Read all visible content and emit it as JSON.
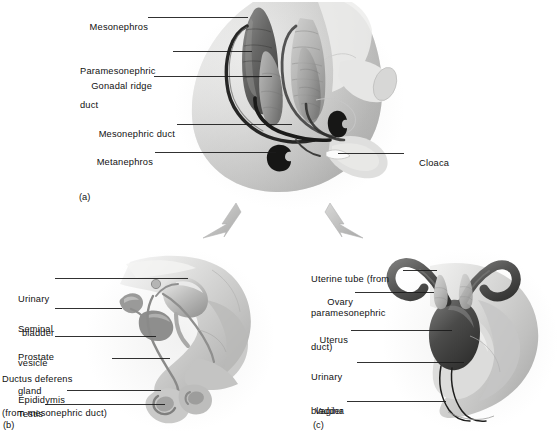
{
  "figure": {
    "background_color": "#ffffff",
    "text_color": "#111111",
    "leader_line_color": "#1b1b1b",
    "arrow_color": "#bdbdbd"
  },
  "panels": [
    {
      "id": "a",
      "id_label": "(a)",
      "name": "indifferent-stage-embryo",
      "labels": [
        {
          "key": "mesonephros",
          "text": "Mesonephros",
          "lines": [
            "Mesonephros"
          ]
        },
        {
          "key": "paramesonephric-duct",
          "text": "Paramesonephric duct",
          "lines": [
            "Paramesonephric",
            "duct"
          ]
        },
        {
          "key": "gonadal-ridge",
          "text": "Gonadal ridge",
          "lines": [
            "Gonadal ridge"
          ]
        },
        {
          "key": "mesonephric-duct",
          "text": "Mesonephric duct",
          "lines": [
            "Mesonephric duct"
          ]
        },
        {
          "key": "metanephros",
          "text": "Metanephros",
          "lines": [
            "Metanephros"
          ]
        },
        {
          "key": "cloaca",
          "text": "Cloaca",
          "lines": [
            "Cloaca"
          ]
        }
      ]
    },
    {
      "id": "b",
      "id_label": "(b)",
      "name": "male-reproductive-system",
      "labels": [
        {
          "key": "urinary-bladder",
          "text": "Urinary bladder",
          "lines": [
            "Urinary",
            "bladder"
          ]
        },
        {
          "key": "seminal-vesicle",
          "text": "Seminal vesicle",
          "lines": [
            "Seminal",
            "vesicle"
          ]
        },
        {
          "key": "prostate-gland",
          "text": "Prostate gland",
          "lines": [
            "Prostate",
            "gland"
          ]
        },
        {
          "key": "ductus-deferens",
          "text": "Ductus deferens (from mesonephric duct)",
          "lines": [
            "Ductus deferens",
            "(from mesonephric duct)"
          ]
        },
        {
          "key": "epididymis",
          "text": "Epididymis",
          "lines": [
            "Epididymis"
          ]
        },
        {
          "key": "testis",
          "text": "Testis",
          "lines": [
            "Testis"
          ]
        }
      ]
    },
    {
      "id": "c",
      "id_label": "(c)",
      "name": "female-reproductive-system",
      "labels": [
        {
          "key": "uterine-tube",
          "text": "Uterine tube (from paramesonephric duct)",
          "lines": [
            "Uterine tube (from",
            "paramesonephric",
            "duct)"
          ]
        },
        {
          "key": "ovary",
          "text": "Ovary",
          "lines": [
            "Ovary"
          ]
        },
        {
          "key": "uterus",
          "text": "Uterus",
          "lines": [
            "Uterus"
          ]
        },
        {
          "key": "urinary-bladder",
          "text": "Urinary bladder",
          "lines": [
            "Urinary",
            "bladder"
          ]
        },
        {
          "key": "vagina",
          "text": "Vagina",
          "lines": [
            "Vagina"
          ]
        }
      ]
    }
  ],
  "arrows": [
    {
      "key": "arrow-to-male",
      "from_panel": "a",
      "to_panel": "b",
      "direction": "down-left"
    },
    {
      "key": "arrow-to-female",
      "from_panel": "a",
      "to_panel": "c",
      "direction": "down-right"
    }
  ],
  "label_text": {
    "a_mesonephros_l1": "Mesonephros",
    "a_paramesonephric_l1": "Paramesonephric",
    "a_paramesonephric_l2": "duct",
    "a_gonadal_l1": "Gonadal ridge",
    "a_mesonephric_duct_l1": "Mesonephric duct",
    "a_metanephros_l1": "Metanephros",
    "a_cloaca_l1": "Cloaca",
    "a_panel_id": "(a)",
    "b_bladder_l1": "Urinary",
    "b_bladder_l2": "bladder",
    "b_seminal_l1": "Seminal",
    "b_seminal_l2": "vesicle",
    "b_prostate_l1": "Prostate",
    "b_prostate_l2": "gland",
    "b_ductus_l1": "Ductus deferens",
    "b_ductus_l2": "(from mesonephric duct)",
    "b_epididymis_l1": "Epididymis",
    "b_testis_l1": "Testis",
    "b_panel_id": "(b)",
    "c_tube_l1": "Uterine tube (from",
    "c_tube_l2": "paramesonephric",
    "c_tube_l3": "duct)",
    "c_ovary_l1": "Ovary",
    "c_uterus_l1": "Uterus",
    "c_bladder_l1": "Urinary",
    "c_bladder_l2": "bladder",
    "c_vagina_l1": "Vagina",
    "c_panel_id": "(c)"
  }
}
